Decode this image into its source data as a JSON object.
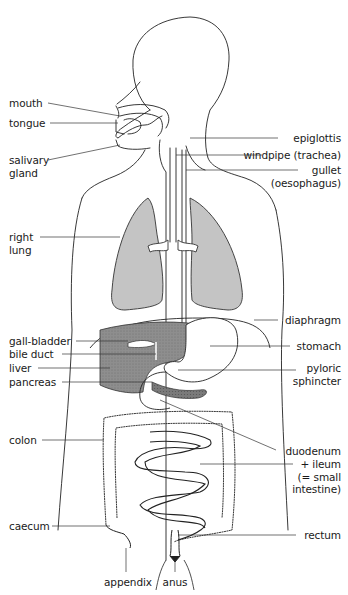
{
  "diagram": {
    "colors": {
      "outline": "#222222",
      "lung_fill": "#c4c4c4",
      "liver_fill": "#8c8c8c",
      "pancreas_fill": "#7a7a7a",
      "background": "#ffffff"
    },
    "labels_left": [
      {
        "id": "mouth",
        "text": "mouth"
      },
      {
        "id": "tongue",
        "text": "tongue"
      },
      {
        "id": "salivary-gland",
        "line1": "salivary",
        "line2": "gland"
      },
      {
        "id": "right-lung",
        "line1": "right",
        "line2": "lung"
      },
      {
        "id": "gall-bladder",
        "text": "gall-bladder"
      },
      {
        "id": "bile-duct",
        "text": "bile duct"
      },
      {
        "id": "liver",
        "text": "liver"
      },
      {
        "id": "pancreas",
        "text": "pancreas"
      },
      {
        "id": "colon",
        "text": "colon"
      },
      {
        "id": "caecum",
        "text": "caecum"
      }
    ],
    "labels_right": [
      {
        "id": "epiglottis",
        "text": "epiglottis"
      },
      {
        "id": "windpipe",
        "text": "windpipe (trachea)"
      },
      {
        "id": "gullet",
        "line1": "gullet",
        "line2": "(oesophagus)"
      },
      {
        "id": "diaphragm",
        "text": "diaphragm"
      },
      {
        "id": "stomach",
        "text": "stomach"
      },
      {
        "id": "pyloric-sphincter",
        "line1": "pyloric",
        "line2": "sphincter"
      },
      {
        "id": "duodenum",
        "text": "duodenum"
      },
      {
        "id": "ileum",
        "line1": "+ ileum",
        "line2": "(= small",
        "line3": "intestine)"
      },
      {
        "id": "rectum",
        "text": "rectum"
      }
    ],
    "labels_bottom": [
      {
        "id": "appendix",
        "text": "appendix"
      },
      {
        "id": "anus",
        "text": "anus"
      }
    ]
  }
}
